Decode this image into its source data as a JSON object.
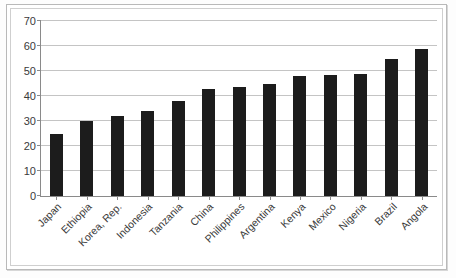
{
  "chart_data": {
    "type": "bar",
    "title": "",
    "subtitle": "",
    "xlabel": "",
    "ylabel": "",
    "ylim": [
      0,
      70
    ],
    "ytick_step": 10,
    "yticks": [
      0,
      10,
      20,
      30,
      40,
      50,
      60,
      70
    ],
    "grid": true,
    "legend": false,
    "legend_position": "none",
    "orientation": "vertical",
    "bar_color": "#1c1c1c",
    "gridline_color": "#c4c4c4",
    "axis_color": "#8a8a8a",
    "label_color": "#3a3a3a",
    "categories": [
      "Japan",
      "Ethiopia",
      "Korea, Rep.",
      "Indonesia",
      "Tanzania",
      "China",
      "Philippines",
      "Argentina",
      "Kenya",
      "Mexico",
      "Nigeria",
      "Brazil",
      "Angola"
    ],
    "values": [
      25,
      30,
      32,
      34,
      38,
      43,
      43.5,
      45,
      48,
      48.5,
      49,
      55,
      59
    ],
    "series": [
      {
        "name": "",
        "values": [
          25,
          30,
          32,
          34,
          38,
          43,
          43.5,
          45,
          48,
          48.5,
          49,
          55,
          59
        ]
      }
    ],
    "annotations": []
  }
}
